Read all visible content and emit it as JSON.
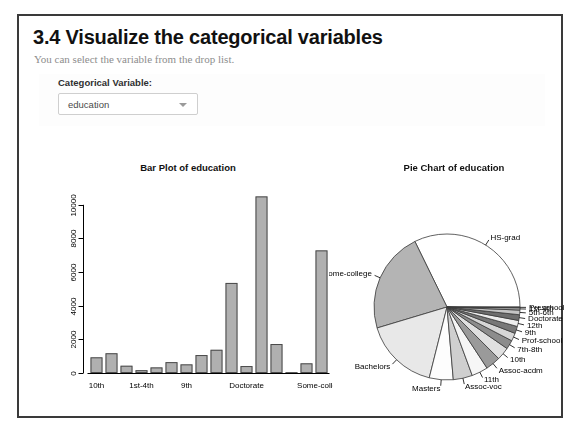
{
  "header": {
    "title": "3.4 Visualize the categorical variables",
    "subtitle": "You can select the variable from the drop list."
  },
  "control": {
    "label": "Categorical Variable:",
    "selected": "education",
    "caret_icon": "chevron-down-icon",
    "options": [
      "education"
    ]
  },
  "colors": {
    "panel_border": "#3a3a3a",
    "bar_fill": "#b0b0b0",
    "bar_stroke": "#4a4a4a",
    "axis": "#000000",
    "title_text": "#111111",
    "subtitle_text": "#8d8d8d"
  },
  "chart_data": [
    {
      "type": "bar",
      "title": "Bar Plot of education",
      "xlabel": "",
      "ylabel": "",
      "ylim": [
        0,
        11000
      ],
      "yticks": [
        0,
        2000,
        4000,
        6000,
        8000,
        10000
      ],
      "ytick_labels": [
        "0",
        "2000",
        "4000",
        "6000",
        "8000",
        "10000"
      ],
      "grid": false,
      "axis_tick_labels_shown": [
        "10th",
        "1st-4th",
        "9th",
        "Doctorate",
        "Some-college"
      ],
      "categories": [
        "10th",
        "11th",
        "12th",
        "1st-4th",
        "5th-6th",
        "7th-8th",
        "9th",
        "Assoc-acdm",
        "Assoc-voc",
        "Bachelors",
        "Doctorate",
        "HS-grad",
        "Masters",
        "Preschool",
        "Prof-school",
        "Some-college"
      ],
      "values": [
        933,
        1175,
        433,
        168,
        333,
        646,
        514,
        1067,
        1382,
        5355,
        413,
        10501,
        1723,
        51,
        576,
        7291
      ]
    },
    {
      "type": "pie",
      "title": "Pie Chart of education",
      "labels": [
        "HS-grad",
        "Some-college",
        "Bachelors",
        "Masters",
        "Assoc-voc",
        "11th",
        "Assoc-acdm",
        "10th",
        "7th-8th",
        "Prof-school",
        "9th",
        "12th",
        "Doctorate",
        "5th-6th",
        "1st-4th",
        "Preschool"
      ],
      "values": [
        10501,
        7291,
        5355,
        1723,
        1382,
        1175,
        1067,
        933,
        646,
        576,
        514,
        433,
        413,
        333,
        168,
        51
      ],
      "start_angle_deg": 0,
      "direction": "counterclockwise",
      "legend": "none"
    }
  ]
}
